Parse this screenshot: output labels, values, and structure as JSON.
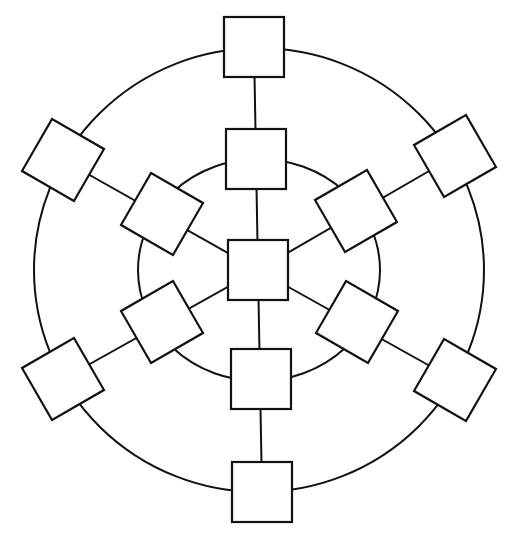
{
  "diagram": {
    "type": "hub-and-spoke radial diagram",
    "colors": {
      "stroke": "#111111",
      "background": "#ffffff",
      "node_fill": "#ffffff"
    },
    "center": {
      "x": 259,
      "y": 270
    },
    "rings": [
      {
        "id": "inner-ring",
        "rx": 121,
        "ry": 111
      },
      {
        "id": "outer-ring",
        "rx": 225,
        "ry": 222
      }
    ],
    "node_size": 60,
    "hub": {
      "id": "hub",
      "x": 258,
      "y": 270,
      "rotation": 0,
      "label": ""
    },
    "spokes": [
      {
        "id": "spoke-top",
        "inner": {
          "x": 256,
          "y": 159,
          "rotation": 0
        },
        "outer": {
          "x": 254,
          "y": 47,
          "rotation": 0
        }
      },
      {
        "id": "spoke-upper-right",
        "inner": {
          "x": 356,
          "y": 211,
          "rotation": -30
        },
        "outer": {
          "x": 455,
          "y": 156,
          "rotation": -30
        }
      },
      {
        "id": "spoke-lower-right",
        "inner": {
          "x": 357,
          "y": 322,
          "rotation": 30
        },
        "outer": {
          "x": 455,
          "y": 380,
          "rotation": 30
        }
      },
      {
        "id": "spoke-bottom",
        "inner": {
          "x": 261,
          "y": 379,
          "rotation": 0
        },
        "outer": {
          "x": 262,
          "y": 492,
          "rotation": 0
        }
      },
      {
        "id": "spoke-lower-left",
        "inner": {
          "x": 162,
          "y": 322,
          "rotation": -30
        },
        "outer": {
          "x": 63,
          "y": 379,
          "rotation": -30
        }
      },
      {
        "id": "spoke-upper-left",
        "inner": {
          "x": 162,
          "y": 214,
          "rotation": 30
        },
        "outer": {
          "x": 63,
          "y": 160,
          "rotation": 30
        }
      }
    ]
  }
}
